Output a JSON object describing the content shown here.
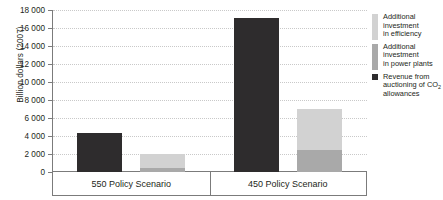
{
  "chart_data": {
    "type": "bar",
    "title": "",
    "xlabel": "",
    "ylabel": "Billion dollars (2007)",
    "ylim": [
      0,
      18000
    ],
    "ytick_labels": [
      "0",
      "2 000",
      "4 000",
      "6 000",
      "8 000",
      "10 000",
      "12 000",
      "14 000",
      "16 000",
      "18 000"
    ],
    "ytick_values": [
      0,
      2000,
      4000,
      6000,
      8000,
      10000,
      12000,
      14000,
      16000,
      18000
    ],
    "grid": true,
    "legend_position": "right",
    "categories": [
      "550 Policy Scenario",
      "450 Policy Scenario"
    ],
    "series": [
      {
        "name": "Revenue from auctioning of CO2 allowances",
        "stack": "revenue",
        "color": "#2e2c2d",
        "values": [
          4300,
          17100
        ]
      },
      {
        "name": "Additional investment in power plants",
        "stack": "investment",
        "color": "#a9a9a9",
        "values": [
          500,
          2400
        ]
      },
      {
        "name": "Additional investment in efficiency",
        "stack": "investment",
        "color": "#d2d2d2",
        "values": [
          1500,
          4600
        ]
      }
    ]
  },
  "axis": {
    "y_title": "Billion dollars (2007)"
  },
  "legend": {
    "items": [
      {
        "label_line1": "Additional",
        "label_line2": "investment",
        "label_line3": "in efficiency",
        "color": "#d2d2d2"
      },
      {
        "label_line1": "Additional",
        "label_line2": "investment",
        "label_line3": "in power plants",
        "color": "#a9a9a9"
      },
      {
        "label_line1": "Revenue from",
        "label_line2": "auctioning of CO",
        "label_sub": "2",
        "label_line3": "allowances",
        "color": "#2e2c2d"
      }
    ]
  },
  "header": {
    "truncated_text": "per year"
  }
}
